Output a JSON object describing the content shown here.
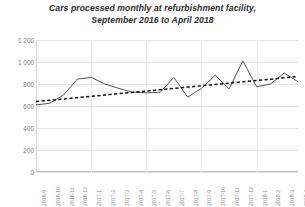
{
  "chart_data": {
    "type": "line",
    "title": "Cars processed monthly at refurbishment facility, September 2016 to April 2018",
    "title_lines": [
      "Cars processed monthly at refurbishment facility,",
      "September 2016 to April 2018"
    ],
    "xlabel": "",
    "ylabel": "",
    "ylim": [
      0,
      1200
    ],
    "yticks": [
      0,
      200,
      400,
      600,
      800,
      1000,
      1200
    ],
    "ytick_labels": [
      "0",
      "200",
      "400",
      "600",
      "800",
      "1 000",
      "1 200"
    ],
    "grid": true,
    "legend": "none",
    "categories": [
      "2016-9",
      "2016-10",
      "2016-11",
      "2016-12",
      "2017-1",
      "2017-2",
      "2017-3",
      "2017-4",
      "2017-5",
      "2017-6",
      "2017-7",
      "2017-8",
      "2017-9",
      "2017-10",
      "2017-11",
      "2017-12",
      "2018-1",
      "2018-2",
      "2018-3",
      "2018-4"
    ],
    "series": [
      {
        "name": "Cars processed",
        "style": "solid",
        "color": "#3f3f3f",
        "values": [
          610,
          625,
          700,
          845,
          860,
          800,
          760,
          725,
          720,
          725,
          860,
          680,
          760,
          880,
          755,
          1010,
          775,
          800,
          900,
          820
        ]
      },
      {
        "name": "Linear trend",
        "style": "dashed",
        "color": "#111111",
        "values": [
          640,
          652,
          664,
          676,
          688,
          700,
          712,
          724,
          736,
          748,
          760,
          772,
          784,
          796,
          808,
          820,
          832,
          844,
          856,
          868
        ]
      }
    ]
  },
  "colors": {
    "line": "#3f3f3f",
    "trend": "#111111",
    "grid": "#e4e4e4",
    "axis": "#bdbdbd",
    "tick_text": "#7d7d7d",
    "title_text": "#2b2b2b",
    "background": "#ffffff"
  }
}
